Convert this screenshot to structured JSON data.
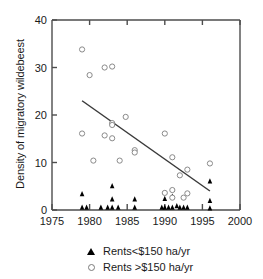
{
  "chart_data": {
    "type": "scatter",
    "title": "",
    "xlabel": "",
    "ylabel": "Density of migratory wildebeest",
    "xlim": [
      1975,
      2000
    ],
    "ylim": [
      0,
      40
    ],
    "xticks": [
      1975,
      1980,
      1985,
      1990,
      1995,
      2000
    ],
    "yticks": [
      0,
      10,
      20,
      30,
      40
    ],
    "grid": false,
    "legend_position": "below-center",
    "series": [
      {
        "name": "Rents<$150 ha/yr",
        "marker": "filled-triangle",
        "color": "#000000",
        "points": [
          [
            1979,
            3.3
          ],
          [
            1979,
            0.5
          ],
          [
            1979.6,
            0.5
          ],
          [
            1981.5,
            0.5
          ],
          [
            1982.4,
            0.5
          ],
          [
            1983,
            5.0
          ],
          [
            1983,
            2.2
          ],
          [
            1983,
            0.5
          ],
          [
            1983.8,
            0.5
          ],
          [
            1986,
            2.2
          ],
          [
            1986,
            0.5
          ],
          [
            1989.6,
            0.5
          ],
          [
            1990,
            2.3
          ],
          [
            1990,
            0.5
          ],
          [
            1990.5,
            0.5
          ],
          [
            1991,
            2.8
          ],
          [
            1991,
            0.5
          ],
          [
            1991.6,
            0.8
          ],
          [
            1992,
            0.5
          ],
          [
            1992.5,
            0.5
          ],
          [
            1993,
            0.5
          ],
          [
            1996,
            6.0
          ],
          [
            1996,
            1.9
          ],
          [
            1996,
            0.3
          ]
        ]
      },
      {
        "name": "Rents >$150 ha/yr",
        "marker": "open-circle",
        "color": "#8a8a8a",
        "points": [
          [
            1979,
            33.8
          ],
          [
            1979,
            16.1
          ],
          [
            1980,
            28.4
          ],
          [
            1980.5,
            10.4
          ],
          [
            1982,
            30.0
          ],
          [
            1982,
            15.7
          ],
          [
            1983,
            30.2
          ],
          [
            1983,
            18.3
          ],
          [
            1983,
            17.9
          ],
          [
            1983,
            15.1
          ],
          [
            1984,
            10.4
          ],
          [
            1984.8,
            19.6
          ],
          [
            1986,
            12.6
          ],
          [
            1986,
            12.1
          ],
          [
            1990,
            16.1
          ],
          [
            1990,
            3.6
          ],
          [
            1991,
            11.1
          ],
          [
            1991,
            4.2
          ],
          [
            1991,
            2.6
          ],
          [
            1992,
            7.3
          ],
          [
            1992.5,
            2.6
          ],
          [
            1993,
            8.5
          ],
          [
            1993,
            3.5
          ],
          [
            1996,
            9.8
          ]
        ]
      }
    ],
    "trendline": {
      "name": "regression-line",
      "x_start": 1979,
      "y_start": 23.0,
      "x_end": 1996,
      "y_end": 4.0,
      "color": "#3a3a3a"
    }
  },
  "legend": {
    "items": [
      {
        "label": "Rents<$150 ha/yr",
        "marker": "filled-triangle"
      },
      {
        "label": "Rents >$150 ha/yr",
        "marker": "open-circle"
      }
    ]
  },
  "axis": {
    "x_tick_labels": [
      "1975",
      "1980",
      "1985",
      "1990",
      "1995",
      "2000"
    ],
    "y_tick_labels": [
      "0",
      "10",
      "20",
      "30",
      "40"
    ],
    "y_axis_title": "Density of migratory wildebeest"
  }
}
